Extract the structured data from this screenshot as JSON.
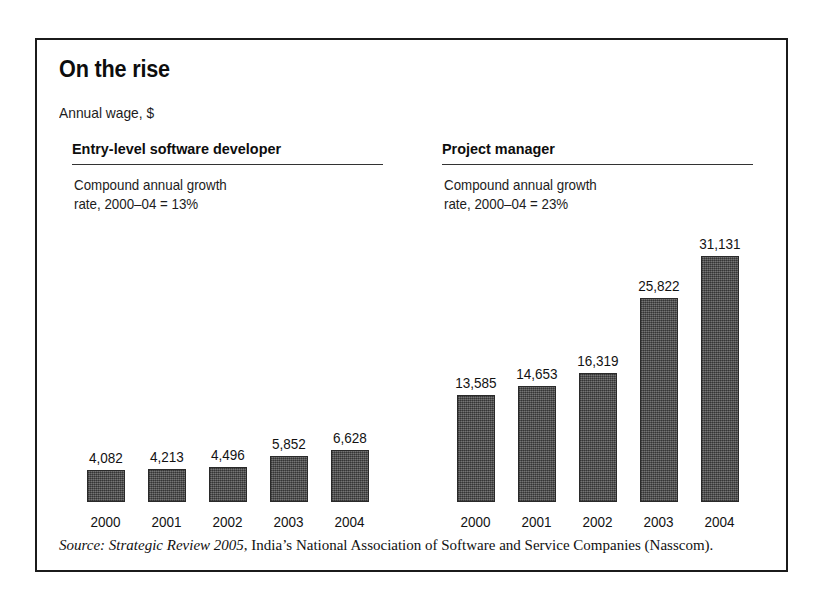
{
  "chart_data": {
    "type": "bar",
    "title": "On the rise",
    "subtitle": "Annual wage, $",
    "xlabel": "",
    "ylabel": "Annual wage, $",
    "grid": false,
    "legend": "none",
    "value_labels": true,
    "shared_y_scale": true,
    "ylim": [
      0,
      31131
    ],
    "categories": [
      "2000",
      "2001",
      "2002",
      "2003",
      "2004"
    ],
    "panels": [
      {
        "name": "Entry-level software developer",
        "note": "Compound annual growth\nrate, 2000–04 = 13%",
        "cagr_percent": 13,
        "cagr_period": "2000–04",
        "categories": [
          "2000",
          "2001",
          "2002",
          "2003",
          "2004"
        ],
        "values": [
          4082,
          4213,
          4496,
          5852,
          6628
        ],
        "value_labels": [
          "4,082",
          "4,213",
          "4,496",
          "5,852",
          "6,628"
        ]
      },
      {
        "name": "Project manager",
        "note": "Compound annual growth\nrate, 2000–04 = 23%",
        "cagr_percent": 23,
        "cagr_period": "2000–04",
        "categories": [
          "2000",
          "2001",
          "2002",
          "2003",
          "2004"
        ],
        "values": [
          13585,
          14653,
          16319,
          25822,
          31131
        ],
        "value_labels": [
          "13,585",
          "14,653",
          "16,319",
          "25,822",
          "31,131"
        ]
      }
    ],
    "series": [
      {
        "name": "Entry-level software developer",
        "values": [
          4082,
          4213,
          4496,
          5852,
          6628
        ]
      },
      {
        "name": "Project manager",
        "values": [
          13585,
          14653,
          16319,
          25822,
          31131
        ]
      }
    ],
    "colors": {
      "bar_fill": "#555555",
      "bar_outline": "#2a2a2a",
      "text": "#111111",
      "frame": "#1b1b1b"
    }
  },
  "source": {
    "label": "Source:",
    "publication": "Strategic Review 2005",
    "rest": ", India’s National Association of Software and Service Companies (Nasscom)."
  }
}
